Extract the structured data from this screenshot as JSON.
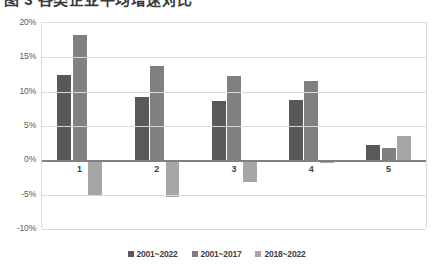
{
  "chart_data": {
    "type": "bar",
    "title": "",
    "xlabel": "",
    "ylabel": "",
    "ylim": [
      -10,
      20
    ],
    "ytick_values": [
      20,
      15,
      10,
      5,
      0,
      -5,
      -10
    ],
    "ytick_labels": [
      "20%",
      "15%",
      "10%",
      "5%",
      "0%",
      "-5%",
      "-10%"
    ],
    "grid": true,
    "legend_position": "bottom",
    "categories": [
      "1",
      "2",
      "3",
      "4",
      "5"
    ],
    "series": [
      {
        "name": "2001~2022",
        "color": "#595959",
        "values": [
          12.5,
          9.2,
          8.6,
          8.8,
          2.2
        ]
      },
      {
        "name": "2001~2017",
        "color": "#808080",
        "values": [
          18.3,
          13.8,
          12.3,
          11.6,
          1.8
        ]
      },
      {
        "name": "2018~2022",
        "color": "#a6a6a6",
        "values": [
          -5.2,
          -5.3,
          -3.1,
          -0.4,
          3.6
        ]
      }
    ]
  },
  "axis": {
    "zero_label": "0%",
    "grid_color": "#d9d9d9",
    "zero_line_color": "#808080"
  },
  "title_strip": {
    "text": "图 3  各类企业平均增速对比"
  }
}
